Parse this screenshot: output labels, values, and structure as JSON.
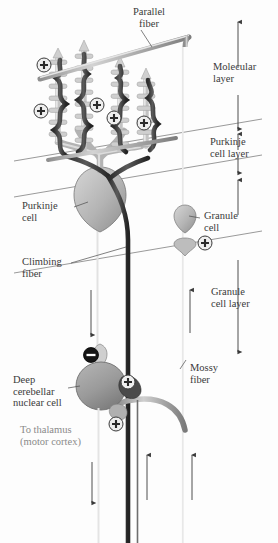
{
  "figure": {
    "background": "#fdfdfd"
  },
  "labels": {
    "parallel_fiber": "Parallel\nfiber",
    "molecular_layer": "Molecular\nlayer",
    "purkinje_cell_layer": "Purkinje\ncell layer",
    "granule_cell_layer": "Granule\ncell layer",
    "purkinje_cell": "Purkinje\ncell",
    "climbing_fiber": "Climbing\nfiber",
    "granule_cell": "Granule\ncell",
    "mossy_fiber": "Mossy\nfiber",
    "deep_cerebellar_nuclear_cell": "Deep\ncerebellar\nnuclear cell",
    "to_thalamus": "To thalamus\n(motor cortex)"
  },
  "synapses": {
    "excitatory_symbol": "+",
    "inhibitory_symbol": "−",
    "excitatory_markers": [
      {
        "id": "pf-spine-1",
        "x": 44,
        "y": 65,
        "sign": "+"
      },
      {
        "id": "pf-spine-2",
        "x": 41,
        "y": 111,
        "sign": "+"
      },
      {
        "id": "pf-spine-3",
        "x": 97,
        "y": 105,
        "sign": "+"
      },
      {
        "id": "pf-spine-4",
        "x": 114,
        "y": 118,
        "sign": "+"
      },
      {
        "id": "pf-spine-5",
        "x": 144,
        "y": 123,
        "sign": "+"
      },
      {
        "id": "granule-mossy",
        "x": 191,
        "y": 235,
        "sign": "+"
      },
      {
        "id": "mossy-dcn",
        "x": 129,
        "y": 382,
        "sign": "+"
      },
      {
        "id": "collateral-dcn",
        "x": 117,
        "y": 424,
        "sign": "+"
      }
    ],
    "inhibitory_markers": [
      {
        "id": "purkinje-dcn",
        "x": 91,
        "y": 355,
        "sign": "−"
      }
    ]
  },
  "colors": {
    "climbing_fiber": "#3a3a3a",
    "purkinje": "#b9b9b9",
    "parallel_fiber": "#9a9a9a",
    "mossy_fiber": "#a8a8a8",
    "dcn_cell": "#9d9d9d",
    "layer_line": "#6f6f6f",
    "plus_fill": "#efefef",
    "minus_fill": "#141414",
    "text": "#3a3a3a"
  },
  "layer_boundaries": [
    {
      "name": "molecular-purkinje-boundary",
      "x1": 14,
      "y1": 160,
      "x2": 262,
      "y2": 118
    },
    {
      "name": "purkinje-granule-boundary",
      "x1": 14,
      "y1": 196,
      "x2": 262,
      "y2": 154
    },
    {
      "name": "granule-lower-boundary",
      "x1": 14,
      "y1": 272,
      "x2": 262,
      "y2": 230
    }
  ],
  "arrows": {
    "molecular_layer_span": {
      "x": 238,
      "y1": 22,
      "y2": 128
    },
    "purkinje_layer_span": {
      "x": 238,
      "y1": 134,
      "y2": 172
    },
    "granule_layer_span": {
      "x": 238,
      "y1": 178,
      "y2": 352
    },
    "purkinje_axon_direction": "down",
    "mossy_fiber_direction": "up",
    "output_direction": "down"
  }
}
